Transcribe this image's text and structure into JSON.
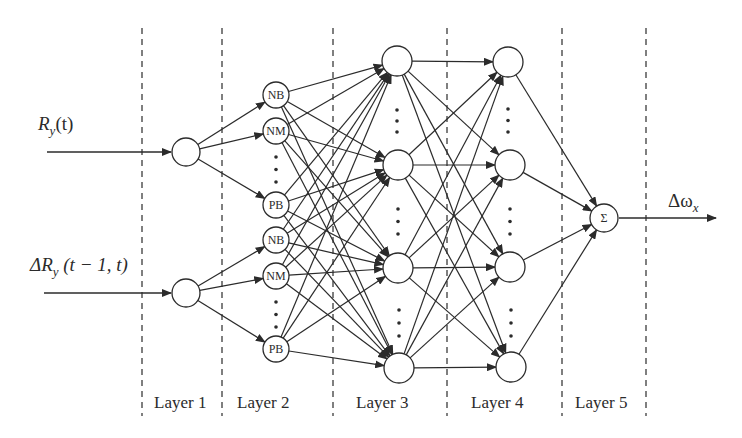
{
  "inputs": [
    {
      "label": "R_y(t)",
      "display": "R",
      "sub": "y",
      "suffix": "(t)"
    },
    {
      "label": "ΔR_y(t − 1, t)",
      "display": "ΔR",
      "sub": "y",
      "suffix": " (t − 1, t)"
    }
  ],
  "output": {
    "label": "Δω_x",
    "display": "Δω",
    "sub": "x"
  },
  "layers": [
    {
      "label": "Layer 1"
    },
    {
      "label": "Layer 2"
    },
    {
      "label": "Layer 3"
    },
    {
      "label": "Layer 4"
    },
    {
      "label": "Layer 5"
    }
  ],
  "layer2_nodes": [
    "NB",
    "NM",
    "PB",
    "NB",
    "NM",
    "PB"
  ],
  "sum_node": "Σ",
  "colors": {
    "line": "#2b2b2b",
    "background": "#ffffff"
  }
}
